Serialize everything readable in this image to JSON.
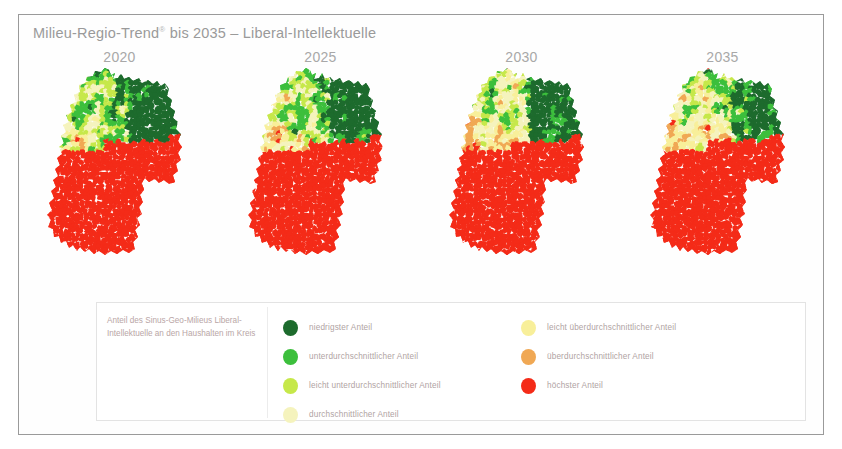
{
  "figure": {
    "title_main": "Milieu-Regio-Trend",
    "title_sup": "®",
    "title_rest": " bis 2035 – Liberal-Intellektuelle"
  },
  "maps": [
    {
      "year": "2020"
    },
    {
      "year": "2025"
    },
    {
      "year": "2030"
    },
    {
      "year": "2035"
    }
  ],
  "legend": {
    "caption": "Anteil des Sinus-Geo-Milieus Liberal-Intellektuelle an den Haushalten im Kreis",
    "left": [
      {
        "label": "niedrigster Anteil",
        "color": "#1d6b2d"
      },
      {
        "label": "unterdurchschnittlicher Anteil",
        "color": "#3cbf3c"
      },
      {
        "label": "leicht unterdurchschnittlicher Anteil",
        "color": "#c6e84a"
      },
      {
        "label": "durchschnittlicher Anteil",
        "color": "#f5f3bd"
      }
    ],
    "right": [
      {
        "label": "leicht überdurchschnittlicher Anteil",
        "color": "#f8ef9a"
      },
      {
        "label": "überdurchschnittlicher Anteil",
        "color": "#f0a854"
      },
      {
        "label": "höchster Anteil",
        "color": "#f42b18"
      }
    ]
  },
  "chart_data": {
    "type": "heatmap",
    "title": "Milieu-Regio-Trend® bis 2035 – Liberal-Intellektuelle",
    "subtitle": "Anteil des Sinus-Geo-Milieus Liberal-Intellektuelle an den Haushalten im Kreis",
    "panels": [
      "2020",
      "2025",
      "2030",
      "2035"
    ],
    "geography": "Germany (Kreise / districts)",
    "legend_position": "bottom",
    "grid": false,
    "categories": [
      "niedrigster Anteil",
      "unterdurchschnittlicher Anteil",
      "leicht unterdurchschnittlicher Anteil",
      "durchschnittlicher Anteil",
      "leicht überdurchschnittlicher Anteil",
      "überdurchschnittlicher Anteil",
      "höchster Anteil"
    ],
    "category_colors": [
      "#1d6b2d",
      "#3cbf3c",
      "#c6e84a",
      "#f5f3bd",
      "#f8ef9a",
      "#f0a854",
      "#f42b18"
    ],
    "series": [
      {
        "name": "2020",
        "region_weights_north_east_green": 0.46,
        "region_weights_south_west_red": 0.3,
        "region_weights_mid_yellow": 0.24
      },
      {
        "name": "2025",
        "region_weights_north_east_green": 0.4,
        "region_weights_south_west_red": 0.33,
        "region_weights_mid_yellow": 0.27
      },
      {
        "name": "2030",
        "region_weights_north_east_green": 0.38,
        "region_weights_south_west_red": 0.35,
        "region_weights_mid_yellow": 0.27
      },
      {
        "name": "2035",
        "region_weights_north_east_green": 0.36,
        "region_weights_south_west_red": 0.38,
        "region_weights_mid_yellow": 0.26
      }
    ]
  }
}
